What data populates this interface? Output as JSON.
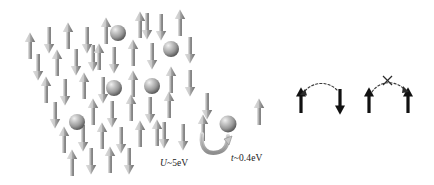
{
  "figure": {
    "background_color": "#ffffff"
  },
  "colors": {
    "spin_arrow_light": "#d2d2d2",
    "spin_arrow_mid": "#9a9a9a",
    "spin_arrow_dark": "#6a6a6a",
    "sphere_light": "#e3e3e3",
    "sphere_mid": "#a8a8a8",
    "sphere_dark": "#636363",
    "hop_arrow": "#b5b5b5",
    "hop_arrow_outline": "#7d7d7d",
    "black_arrow": "#111111",
    "dashed_arc": "#3a3a3a",
    "label_text": "#1a1a1a"
  },
  "labels": {
    "u_energy": {
      "symbol": "U",
      "rest": "~5eV",
      "full": "U~5eV"
    },
    "t_energy": {
      "symbol": "t",
      "rest": "~0.4eV",
      "full": "t~0.4eV"
    }
  },
  "lattice": {
    "description": "Sheared (parallelogram) 2D grid of alternating up/down spin arrows",
    "spin_up_symbol": "↑",
    "spin_down_symbol": "↓",
    "spins": [
      {
        "x": 30,
        "y": 46,
        "dir": "up"
      },
      {
        "x": 49,
        "y": 40,
        "dir": "down"
      },
      {
        "x": 68,
        "y": 36,
        "dir": "up"
      },
      {
        "x": 87,
        "y": 40,
        "dir": "down"
      },
      {
        "x": 106,
        "y": 31,
        "dir": "up"
      },
      {
        "x": 143,
        "y": 25,
        "dir": "double"
      },
      {
        "x": 161,
        "y": 27,
        "dir": "down"
      },
      {
        "x": 180,
        "y": 23,
        "dir": "up"
      },
      {
        "x": 38,
        "y": 67,
        "dir": "down"
      },
      {
        "x": 57,
        "y": 63,
        "dir": "up"
      },
      {
        "x": 76,
        "y": 62,
        "dir": "down"
      },
      {
        "x": 96,
        "y": 57,
        "dir": "double"
      },
      {
        "x": 114,
        "y": 60,
        "dir": "down"
      },
      {
        "x": 133,
        "y": 53,
        "dir": "up"
      },
      {
        "x": 152,
        "y": 56,
        "dir": "down"
      },
      {
        "x": 171,
        "y": 52,
        "dir": "down"
      },
      {
        "x": 190,
        "y": 50,
        "dir": "down"
      },
      {
        "x": 46,
        "y": 90,
        "dir": "up"
      },
      {
        "x": 65,
        "y": 92,
        "dir": "down"
      },
      {
        "x": 84,
        "y": 86,
        "dir": "up"
      },
      {
        "x": 122,
        "y": 84,
        "dir": "up"
      },
      {
        "x": 141,
        "y": 84,
        "dir": "down"
      },
      {
        "x": 160,
        "y": 80,
        "dir": "up"
      },
      {
        "x": 179,
        "y": 83,
        "dir": "down"
      },
      {
        "x": 198,
        "y": 79,
        "dir": "up"
      },
      {
        "x": 55,
        "y": 115,
        "dir": "down"
      },
      {
        "x": 93,
        "y": 112,
        "dir": "down"
      },
      {
        "x": 112,
        "y": 110,
        "dir": "up"
      },
      {
        "x": 131,
        "y": 112,
        "dir": "down"
      },
      {
        "x": 150,
        "y": 108,
        "dir": "up"
      },
      {
        "x": 169,
        "y": 110,
        "dir": "down"
      },
      {
        "x": 207,
        "y": 106,
        "dir": "down"
      },
      {
        "x": 245,
        "y": 102,
        "dir": "up"
      },
      {
        "x": 64,
        "y": 140,
        "dir": "up"
      },
      {
        "x": 83,
        "y": 138,
        "dir": "down"
      },
      {
        "x": 102,
        "y": 136,
        "dir": "up"
      },
      {
        "x": 121,
        "y": 138,
        "dir": "down"
      },
      {
        "x": 140,
        "y": 134,
        "dir": "up"
      },
      {
        "x": 159,
        "y": 133,
        "dir": "double"
      },
      {
        "x": 178,
        "y": 136,
        "dir": "down"
      },
      {
        "x": 197,
        "y": 130,
        "dir": "up"
      },
      {
        "x": 234,
        "y": 126,
        "dir": "up"
      },
      {
        "x": 72,
        "y": 163,
        "dir": "up"
      },
      {
        "x": 91,
        "y": 161,
        "dir": "down"
      },
      {
        "x": 110,
        "y": 160,
        "dir": "up"
      },
      {
        "x": 129,
        "y": 161,
        "dir": "down"
      }
    ],
    "holes": [
      {
        "x": 118,
        "y": 33,
        "r": 8
      },
      {
        "x": 171,
        "y": 49,
        "r": 8
      },
      {
        "x": 114,
        "y": 88,
        "r": 8
      },
      {
        "x": 152,
        "y": 86,
        "r": 8
      },
      {
        "x": 77,
        "y": 122,
        "r": 8
      },
      {
        "x": 228,
        "y": 124,
        "r": 9
      }
    ]
  },
  "right_panel": {
    "allowed": {
      "name": "antiparallel-spins-hopping-allowed",
      "left_arrow": "up",
      "right_arrow": "down",
      "arc": "dashed-curved-arrow",
      "forbidden": false
    },
    "forbidden": {
      "name": "parallel-spins-hopping-forbidden",
      "left_arrow": "up",
      "right_arrow": "up",
      "arc": "dashed-curved-arrow",
      "forbidden": true,
      "cross_mark": "X"
    }
  }
}
